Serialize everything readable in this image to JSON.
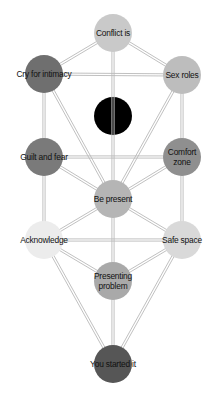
{
  "diagram": {
    "title": "",
    "style": {
      "background": "#ffffff",
      "edge_color": "#b9b9b9",
      "edge_gap": 2.2,
      "node_radius": 19
    },
    "nodes": [
      {
        "id": "conflict",
        "label": "Conflict is",
        "x": 113,
        "y": 33,
        "color": "#c9c9c9"
      },
      {
        "id": "cry",
        "label": "Cry for intimacy",
        "x": 44,
        "y": 74,
        "color": "#6f6f6f"
      },
      {
        "id": "sex",
        "label": "Sex roles",
        "x": 182,
        "y": 75,
        "color": "#bdbdbd"
      },
      {
        "id": "hidden",
        "label": "",
        "x": 113,
        "y": 116,
        "color": "#000000"
      },
      {
        "id": "guilt",
        "label": "Guilt and fear",
        "x": 44,
        "y": 157,
        "color": "#7a7a7a"
      },
      {
        "id": "comfort",
        "label": "Comfort\nzone",
        "x": 182,
        "y": 157,
        "color": "#8f8f8f"
      },
      {
        "id": "present",
        "label": "Be present",
        "x": 113,
        "y": 199,
        "color": "#b5b5b5"
      },
      {
        "id": "ack",
        "label": "Acknowledge",
        "x": 44,
        "y": 240,
        "color": "#ececec"
      },
      {
        "id": "safe",
        "label": "Safe space",
        "x": 182,
        "y": 240,
        "color": "#d9d9d9"
      },
      {
        "id": "presenting",
        "label": "Presenting\nproblem",
        "x": 113,
        "y": 281,
        "color": "#a9a9a9"
      },
      {
        "id": "started",
        "label": "You started it",
        "x": 113,
        "y": 364,
        "color": "#565656"
      }
    ],
    "edges": [
      [
        "conflict",
        "cry"
      ],
      [
        "conflict",
        "sex"
      ],
      [
        "conflict",
        "present"
      ],
      [
        "cry",
        "sex"
      ],
      [
        "cry",
        "guilt"
      ],
      [
        "cry",
        "present"
      ],
      [
        "sex",
        "comfort"
      ],
      [
        "sex",
        "present"
      ],
      [
        "guilt",
        "comfort"
      ],
      [
        "guilt",
        "present"
      ],
      [
        "guilt",
        "ack"
      ],
      [
        "comfort",
        "present"
      ],
      [
        "comfort",
        "safe"
      ],
      [
        "present",
        "ack"
      ],
      [
        "present",
        "safe"
      ],
      [
        "present",
        "presenting"
      ],
      [
        "ack",
        "safe"
      ],
      [
        "ack",
        "presenting"
      ],
      [
        "ack",
        "started"
      ],
      [
        "safe",
        "presenting"
      ],
      [
        "safe",
        "started"
      ],
      [
        "presenting",
        "started"
      ]
    ]
  }
}
